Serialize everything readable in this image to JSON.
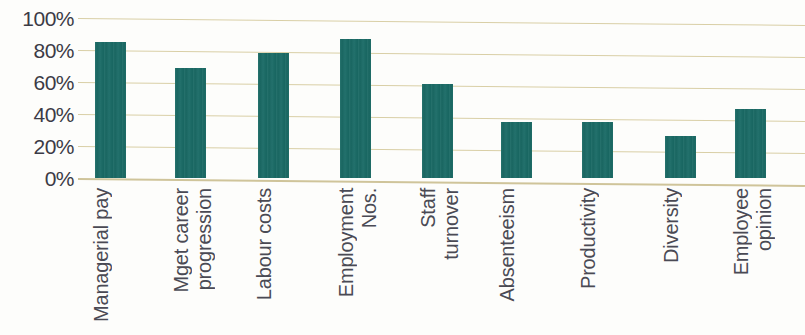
{
  "chart_data": {
    "type": "bar",
    "title": "",
    "subtitle": "",
    "xlabel": "",
    "ylabel": "",
    "ylim": [
      0,
      100
    ],
    "grid": true,
    "legend": false,
    "legend_position": "none",
    "y_tick_labels": [
      "100%",
      "80%",
      "60%",
      "40%",
      "20%",
      "0%"
    ],
    "y_tick_values": [
      100,
      80,
      60,
      40,
      20,
      0
    ],
    "categories": [
      "Managerial pay",
      "Mget career progression",
      "Labour costs",
      "Employment Nos.",
      "Staff turnover",
      "Absenteeism",
      "Productivity",
      "Diversity",
      "Employee opinion"
    ],
    "category_lines": [
      [
        "Managerial pay"
      ],
      [
        "Mget career",
        "progression"
      ],
      [
        "Labour costs"
      ],
      [
        "Employment",
        "Nos."
      ],
      [
        "Staff",
        "turnover"
      ],
      [
        "Absenteeism"
      ],
      [
        "Productivity"
      ],
      [
        "Diversity"
      ],
      [
        "Employee",
        "opinion"
      ]
    ],
    "values": [
      85,
      69,
      78,
      87,
      59,
      35,
      35,
      26,
      43
    ],
    "bar_color": "#1a6b66",
    "gridline_color": "#d9cfa6",
    "background_color": "#fdfdfb",
    "axis_text_color": "#3b3b46"
  }
}
